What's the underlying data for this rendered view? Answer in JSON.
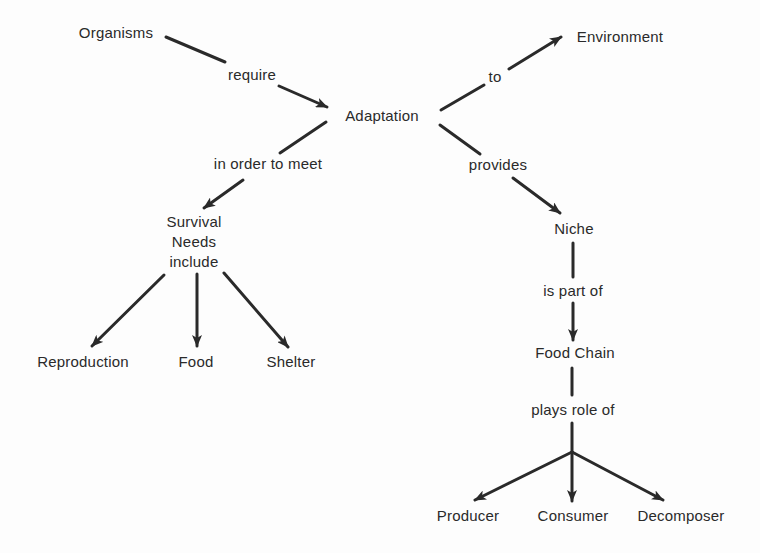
{
  "diagram": {
    "type": "concept-map",
    "concepts": {
      "organisms": "Organisms",
      "adaptation": "Adaptation",
      "environment": "Environment",
      "survival_needs": [
        "Survival",
        "Needs",
        "include"
      ],
      "niche": "Niche",
      "food_chain": "Food Chain",
      "reproduction": "Reproduction",
      "food": "Food",
      "shelter": "Shelter",
      "producer": "Producer",
      "consumer": "Consumer",
      "decomposer": "Decomposer"
    },
    "link_labels": {
      "require": "require",
      "to": "to",
      "in_order_to_meet": "in order to meet",
      "provides": "provides",
      "is_part_of": "is part of",
      "plays_role_of": "plays role of"
    },
    "edges": [
      {
        "from": "Organisms",
        "label": "require",
        "to": "Adaptation"
      },
      {
        "from": "Adaptation",
        "label": "to",
        "to": "Environment"
      },
      {
        "from": "Adaptation",
        "label": "in order to meet",
        "to": "Survival Needs"
      },
      {
        "from": "Adaptation",
        "label": "provides",
        "to": "Niche"
      },
      {
        "from": "Survival Needs",
        "label": "include",
        "to": "Reproduction"
      },
      {
        "from": "Survival Needs",
        "label": "include",
        "to": "Food"
      },
      {
        "from": "Survival Needs",
        "label": "include",
        "to": "Shelter"
      },
      {
        "from": "Niche",
        "label": "is part of",
        "to": "Food Chain"
      },
      {
        "from": "Food Chain",
        "label": "plays role of",
        "to": "Producer"
      },
      {
        "from": "Food Chain",
        "label": "plays role of",
        "to": "Consumer"
      },
      {
        "from": "Food Chain",
        "label": "plays role of",
        "to": "Decomposer"
      }
    ],
    "colors": {
      "ink": "#2a2a2a",
      "background": "#fdfdfd"
    }
  }
}
